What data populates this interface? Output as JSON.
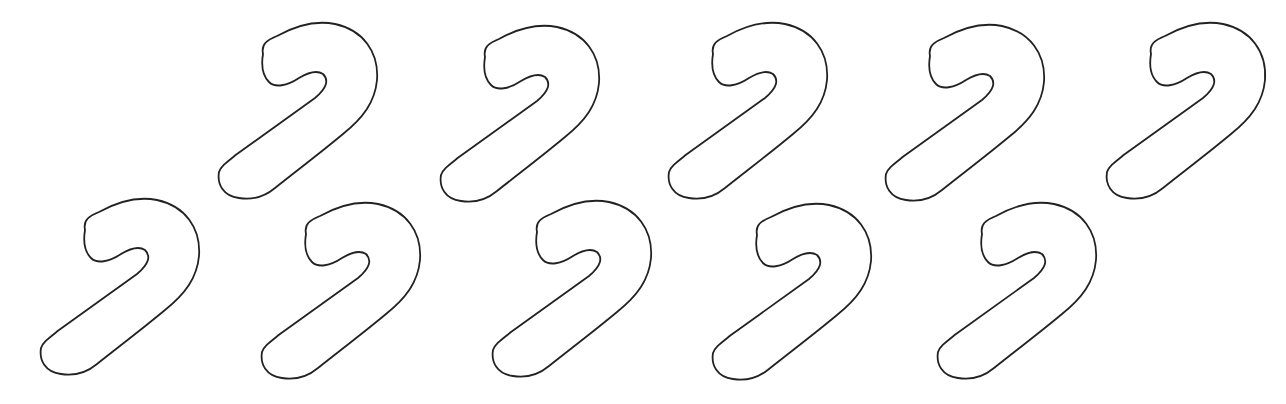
{
  "page": {
    "background": "#ffffff",
    "stroke_color": "#222222"
  },
  "shapes": [
    {
      "name": "candy-cane-outline",
      "row": 1,
      "index": 1,
      "x": 215,
      "y": 22
    },
    {
      "name": "candy-cane-outline",
      "row": 1,
      "index": 2,
      "x": 437,
      "y": 25
    },
    {
      "name": "candy-cane-outline",
      "row": 1,
      "index": 3,
      "x": 665,
      "y": 22
    },
    {
      "name": "candy-cane-outline",
      "row": 1,
      "index": 4,
      "x": 882,
      "y": 24
    },
    {
      "name": "candy-cane-outline",
      "row": 1,
      "index": 5,
      "x": 1103,
      "y": 22
    },
    {
      "name": "candy-cane-outline",
      "row": 2,
      "index": 1,
      "x": 37,
      "y": 198
    },
    {
      "name": "candy-cane-outline",
      "row": 2,
      "index": 2,
      "x": 258,
      "y": 202
    },
    {
      "name": "candy-cane-outline",
      "row": 2,
      "index": 3,
      "x": 489,
      "y": 200
    },
    {
      "name": "candy-cane-outline",
      "row": 2,
      "index": 4,
      "x": 709,
      "y": 203
    },
    {
      "name": "candy-cane-outline",
      "row": 2,
      "index": 5,
      "x": 934,
      "y": 202
    }
  ]
}
